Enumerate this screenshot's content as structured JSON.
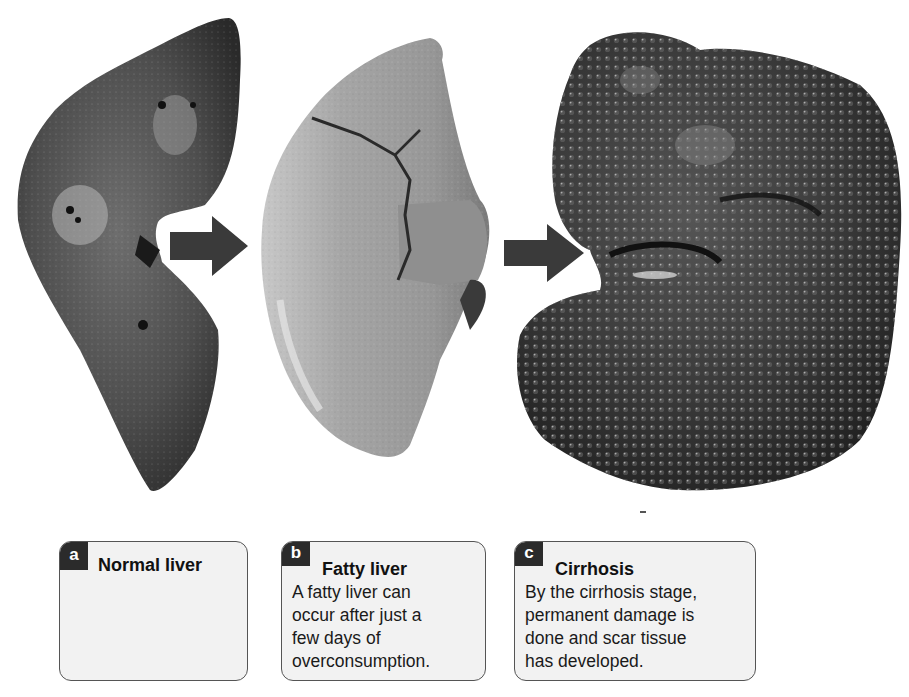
{
  "figure": {
    "panels": [
      {
        "letter": "a",
        "title": "Normal liver",
        "description": ""
      },
      {
        "letter": "b",
        "title": "Fatty liver",
        "description_lines": [
          "A fatty liver can",
          "occur after just a",
          "few days of",
          "overconsumption."
        ]
      },
      {
        "letter": "c",
        "title": "Cirrhosis",
        "description_lines": [
          "By the cirrhosis stage,",
          "permanent damage is",
          "done and scar tissue",
          "has developed."
        ]
      }
    ],
    "arrows": [
      {
        "from": "a",
        "to": "b"
      },
      {
        "from": "b",
        "to": "c"
      }
    ],
    "colors": {
      "arrow": "#3a3a3a",
      "label_tab": "#2b2b2b",
      "box_fill": "#f2f2f2",
      "box_border": "#555555",
      "normal_liver": "#4a4a4a",
      "fatty_liver": "#9a9a9a",
      "cirrhotic_liver": "#2e2e2e"
    }
  }
}
